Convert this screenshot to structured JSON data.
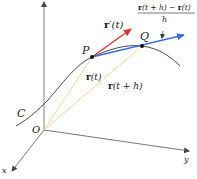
{
  "figure": {
    "type": "3d-vector-diagram",
    "axes": {
      "z": {
        "label": "z"
      },
      "y": {
        "label": "y"
      },
      "x": {
        "label": "x"
      }
    },
    "origin_label": "O",
    "curve_label": "C",
    "points": {
      "P": {
        "label": "P"
      },
      "Q": {
        "label": "Q"
      }
    },
    "vectors": {
      "r_t": {
        "label_bold": "r",
        "label_rest": "(t)",
        "color": "#f3dca0"
      },
      "r_t_plus_h": {
        "label_bold": "r",
        "label_rest": "(t + h)",
        "color": "#f3dca0"
      },
      "r_prime_t": {
        "label_bold": "r",
        "label_prime": "′",
        "label_rest": "(t)",
        "color": "#e03030"
      },
      "secant": {
        "color": "#3a6fd8"
      }
    },
    "difference_quotient": {
      "numerator_bold1": "r",
      "numerator_mid": "(t + h) − ",
      "numerator_bold2": "r",
      "numerator_end": "(t)",
      "denominator": "h"
    },
    "colors": {
      "axis": "#555555",
      "curve": "#333344",
      "tangent": "#e03030",
      "secant": "#3a6fd8",
      "position": "#f3dca0"
    }
  }
}
